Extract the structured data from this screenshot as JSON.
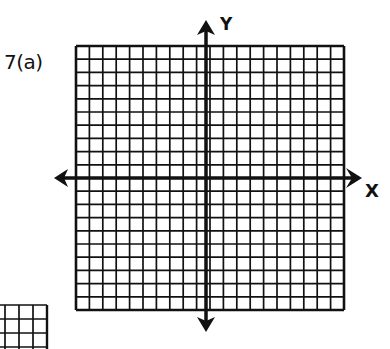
{
  "problem": {
    "label": "7(a)"
  },
  "axes": {
    "x_label": "X",
    "y_label": "Y"
  },
  "grid": {
    "columns": 20,
    "rows": 20,
    "x_range": [
      -10,
      10
    ],
    "y_range": [
      -10,
      10
    ],
    "line_color": "#111111",
    "background": "#ffffff"
  },
  "partial_grid": {
    "visible_columns": 3,
    "visible_rows": 2
  }
}
